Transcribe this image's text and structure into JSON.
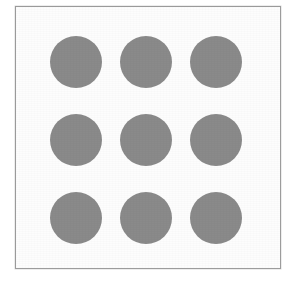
{
  "figure": {
    "title": "",
    "caption": "",
    "background_color": "#ffffff",
    "frame": {
      "border_color": "#9a9a9a",
      "fill_color": "#fdfdfd",
      "border_width_px": 1,
      "x": 15,
      "y": 6,
      "width": 266,
      "height": 263
    }
  },
  "chart_data": {
    "type": "scatter",
    "title": "",
    "subtitle": "",
    "xlabel": "",
    "ylabel": "",
    "grid": false,
    "legend": "none",
    "rows": 3,
    "columns": 3,
    "marker": "circle",
    "marker_color": "#8a8a8a",
    "marker_diameter_px": 52,
    "column_pitch_px": 70,
    "row_pitch_px": 78,
    "xlim": [
      0,
      291
    ],
    "ylim": [
      0,
      283
    ],
    "x": [
      76,
      146,
      216,
      76,
      146,
      216,
      76,
      146,
      216
    ],
    "y": [
      62,
      62,
      62,
      140,
      140,
      140,
      218,
      218,
      218
    ],
    "points": [
      {
        "id": "dot-r1c1",
        "row": 1,
        "col": 1,
        "cx": 76,
        "cy": 62,
        "r": 26
      },
      {
        "id": "dot-r1c2",
        "row": 1,
        "col": 2,
        "cx": 146,
        "cy": 62,
        "r": 26
      },
      {
        "id": "dot-r1c3",
        "row": 1,
        "col": 3,
        "cx": 216,
        "cy": 62,
        "r": 26
      },
      {
        "id": "dot-r2c1",
        "row": 2,
        "col": 1,
        "cx": 76,
        "cy": 140,
        "r": 26
      },
      {
        "id": "dot-r2c2",
        "row": 2,
        "col": 2,
        "cx": 146,
        "cy": 140,
        "r": 26
      },
      {
        "id": "dot-r2c3",
        "row": 2,
        "col": 3,
        "cx": 216,
        "cy": 140,
        "r": 26
      },
      {
        "id": "dot-r3c1",
        "row": 3,
        "col": 1,
        "cx": 76,
        "cy": 218,
        "r": 26
      },
      {
        "id": "dot-r3c2",
        "row": 3,
        "col": 2,
        "cx": 146,
        "cy": 218,
        "r": 26
      },
      {
        "id": "dot-r3c3",
        "row": 3,
        "col": 3,
        "cx": 216,
        "cy": 218,
        "r": 26
      }
    ]
  }
}
